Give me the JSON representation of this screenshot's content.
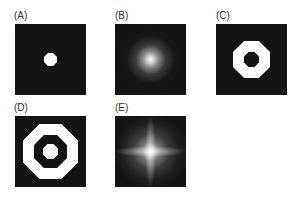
{
  "panels": [
    {
      "id": "A",
      "label": "(A)",
      "description": "small white dot on black"
    },
    {
      "id": "B",
      "label": "(B)",
      "description": "gaussian blurred spot"
    },
    {
      "id": "C",
      "label": "(C)",
      "description": "white ring (annulus)"
    },
    {
      "id": "D",
      "label": "(D)",
      "description": "white ring with central dot"
    },
    {
      "id": "E",
      "label": "(E)",
      "description": "star-shaped diffraction pattern"
    }
  ],
  "colors": {
    "background": "#ffffff",
    "panel": "#141414",
    "foreground": "#ffffff",
    "label": "#333333"
  }
}
